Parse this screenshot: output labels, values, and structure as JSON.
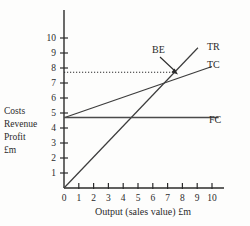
{
  "chart_data": {
    "type": "line",
    "title": "",
    "xlabel": "Output (sales value) £m",
    "ylabel": "Costs\nRevenue\nProfit\n£m",
    "ylabel_lines": [
      "Costs",
      "Revenue",
      "Profit",
      "£m"
    ],
    "xlim": [
      0,
      10.5
    ],
    "ylim": [
      0,
      10.6
    ],
    "xticks": [
      0,
      1,
      2,
      3,
      4,
      5,
      6,
      7,
      8,
      9,
      10
    ],
    "xtick_labels": [
      "0",
      "1",
      "2",
      "3",
      "4",
      "5",
      "6",
      "7",
      "8",
      "9",
      "10"
    ],
    "yticks": [
      1,
      2,
      3,
      4,
      5,
      6,
      7,
      8,
      9,
      10
    ],
    "ytick_labels": [
      "1",
      "2",
      "3",
      "4",
      "5",
      "6",
      "7",
      "8",
      "9",
      "10"
    ],
    "grid": false,
    "legend_position": "inline-right",
    "series": [
      {
        "name": "TR",
        "label": "TR",
        "description": "Total Revenue",
        "points": [
          [
            0,
            0
          ],
          [
            9.05,
            9.35
          ]
        ],
        "slope": 1.03,
        "intercept": 0,
        "color": "#3c3c3c"
      },
      {
        "name": "TC",
        "label": "TC",
        "description": "Total Cost",
        "points": [
          [
            0.05,
            4.7
          ],
          [
            10.0,
            8.1
          ]
        ],
        "slope": 0.342,
        "intercept": 4.68,
        "color": "#3c3c3c"
      },
      {
        "name": "FC",
        "label": "FC",
        "description": "Fixed Cost",
        "points": [
          [
            0,
            4.7
          ],
          [
            10.45,
            4.7
          ]
        ],
        "slope": 0,
        "intercept": 4.7,
        "color": "#4a4a4a"
      }
    ],
    "annotations": [
      {
        "name": "BE",
        "label": "BE",
        "description": "Break-even point",
        "point": [
          7.5,
          7.72
        ],
        "label_position": [
          5.9,
          9.25
        ]
      }
    ],
    "guide_lines": [
      {
        "name": "break-even-level",
        "orientation": "horizontal",
        "value": 7.72,
        "style": "dotted",
        "from_x": 0,
        "to_x": 7.5
      }
    ]
  },
  "axis_title": {
    "x": "Output (sales value) £m"
  },
  "colors": {
    "background": "#fdfdfc",
    "axis": "#2b2b2b",
    "line": "#3c3c3c",
    "text": "#2b2b2b"
  }
}
